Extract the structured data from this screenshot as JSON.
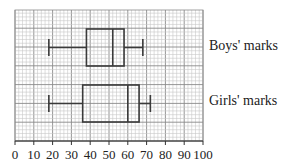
{
  "chart_data": {
    "type": "boxplot",
    "title": "",
    "xlabel": "",
    "ylabel": "",
    "xlim": [
      0,
      100
    ],
    "x_ticks": [
      0,
      10,
      20,
      30,
      40,
      50,
      60,
      70,
      80,
      90,
      100
    ],
    "x_tick_labels": [
      "0",
      "10",
      "20",
      "30",
      "40",
      "50",
      "60",
      "70",
      "80",
      "90",
      "100"
    ],
    "grid": true,
    "grid_minor_step": 2,
    "grid_major_step": 10,
    "series": [
      {
        "name": "Boys' marks",
        "min": 18,
        "q1": 38,
        "median": 52,
        "q3": 58,
        "max": 68
      },
      {
        "name": "Girls' marks",
        "min": 18,
        "q1": 36,
        "median": 60,
        "q3": 66,
        "max": 72
      }
    ]
  },
  "labels": {
    "boys": "Boys' marks",
    "girls": "Girls' marks"
  },
  "colors": {
    "grid_minor": "#c8c8c8",
    "grid_major": "#8a8a8a",
    "box_stroke": "#3a3a3a",
    "axis": "#333333"
  }
}
